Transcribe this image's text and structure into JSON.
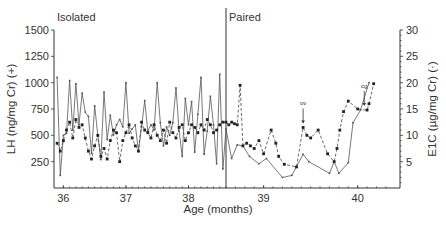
{
  "chart_data": {
    "type": "line",
    "title": "",
    "xlabel": "Age (months)",
    "ylabel_left": "LH (ng/mg Cr) (+)",
    "ylabel_right": "E1C (µg/mg Cr) (·)",
    "xlim": [
      35.85,
      40.45
    ],
    "x_break": 38.6,
    "ylim_left": [
      0,
      1500
    ],
    "ylim_right": [
      0,
      30
    ],
    "x_ticks": [
      36,
      37,
      38,
      39,
      40
    ],
    "x_tick_labels": [
      "36",
      "37",
      "38",
      "39",
      "40"
    ],
    "y_ticks_left": [
      250,
      500,
      750,
      1000,
      1250,
      1500
    ],
    "y_tick_labels_left": [
      "250",
      "500",
      "750",
      "1000",
      "1250",
      "1500"
    ],
    "y_ticks_right": [
      5,
      10,
      15,
      20,
      25,
      30
    ],
    "y_tick_labels_right": [
      "5",
      "10",
      "15",
      "20",
      "25",
      "30"
    ],
    "grid": false,
    "phase_labels": [
      "Isolated",
      "Paired"
    ],
    "phase_divider_x": 38.6,
    "annotations": [
      {
        "text": "ov",
        "x": 39.42,
        "series": "E1C"
      },
      {
        "text": "cg",
        "x": 40.07,
        "series": "E1C"
      }
    ],
    "series": [
      {
        "name": "LH (ng/mg Cr)",
        "axis": "left",
        "style": "solid",
        "marker": "plus",
        "x": [
          35.9,
          35.95,
          36.0,
          36.05,
          36.1,
          36.15,
          36.2,
          36.25,
          36.3,
          36.35,
          36.4,
          36.45,
          36.5,
          36.55,
          36.6,
          36.65,
          36.7,
          36.75,
          36.8,
          36.85,
          36.9,
          36.95,
          37.0,
          37.05,
          37.1,
          37.15,
          37.2,
          37.25,
          37.3,
          37.35,
          37.4,
          37.45,
          37.5,
          37.55,
          37.6,
          37.65,
          37.7,
          37.75,
          37.8,
          37.85,
          37.9,
          37.95,
          38.0,
          38.05,
          38.1,
          38.15,
          38.2,
          38.25,
          38.3,
          38.35,
          38.4,
          38.45,
          38.5,
          38.55,
          38.6,
          38.66,
          38.72,
          38.78,
          38.85,
          38.95,
          39.03,
          39.2,
          39.3,
          39.42,
          39.48,
          39.7,
          39.75,
          39.8,
          39.9,
          39.95,
          40.03,
          40.12
        ],
        "values": [
          1050,
          120,
          500,
          520,
          1020,
          550,
          990,
          600,
          900,
          720,
          680,
          330,
          780,
          500,
          270,
          910,
          460,
          690,
          500,
          600,
          650,
          580,
          1000,
          520,
          560,
          600,
          350,
          580,
          830,
          540,
          600,
          550,
          1000,
          620,
          400,
          580,
          500,
          620,
          950,
          540,
          300,
          850,
          600,
          820,
          340,
          700,
          1050,
          320,
          540,
          870,
          600,
          230,
          1080,
          180,
          560,
          280,
          410,
          400,
          300,
          230,
          280,
          100,
          120,
          320,
          250,
          140,
          250,
          140,
          240,
          620,
          740,
          1000
        ]
      },
      {
        "name": "E1C (µg/mg Cr)",
        "axis": "right",
        "style": "dashed",
        "marker": "dot",
        "x": [
          35.9,
          35.95,
          36.0,
          36.05,
          36.1,
          36.15,
          36.2,
          36.25,
          36.3,
          36.35,
          36.4,
          36.45,
          36.5,
          36.55,
          36.6,
          36.65,
          36.7,
          36.75,
          36.8,
          36.85,
          36.9,
          36.95,
          37.0,
          37.05,
          37.1,
          37.15,
          37.2,
          37.25,
          37.3,
          37.35,
          37.4,
          37.45,
          37.5,
          37.55,
          37.6,
          37.65,
          37.7,
          37.75,
          37.8,
          37.85,
          37.9,
          37.95,
          38.0,
          38.05,
          38.1,
          38.15,
          38.2,
          38.25,
          38.3,
          38.35,
          38.4,
          38.45,
          38.5,
          38.55,
          38.6,
          38.63,
          38.66,
          38.69,
          38.72,
          38.75,
          38.78,
          38.82,
          38.86,
          38.9,
          38.95,
          39.0,
          39.08,
          39.13,
          39.16,
          39.22,
          39.35,
          39.42,
          39.46,
          39.5,
          39.58,
          39.68,
          39.75,
          39.78,
          39.81,
          39.85,
          39.9,
          40.0,
          40.1,
          40.12,
          40.17
        ],
        "values": [
          8.5,
          7.0,
          9.0,
          11.0,
          12.5,
          9.5,
          13.0,
          11.5,
          12.0,
          9.5,
          7.0,
          5.5,
          8.0,
          10.0,
          6.0,
          7.5,
          5.5,
          9.0,
          11.0,
          10.5,
          5.0,
          9.0,
          10.5,
          12.0,
          9.5,
          8.0,
          7.0,
          12.5,
          11.0,
          10.5,
          9.5,
          12.0,
          10.0,
          9.0,
          11.0,
          8.5,
          12.5,
          10.5,
          9.5,
          11.5,
          12.0,
          9.0,
          10.5,
          12.0,
          11.5,
          10.5,
          12.0,
          11.0,
          13.0,
          12.0,
          10.5,
          11.0,
          12.0,
          12.5,
          12.5,
          12.0,
          12.5,
          12.2,
          12.0,
          19.5,
          8.0,
          8.5,
          8.0,
          7.5,
          9.0,
          6.5,
          11.0,
          8.5,
          6.0,
          4.5,
          4.0,
          11.5,
          10.0,
          9.5,
          11.0,
          6.5,
          5.0,
          7.5,
          11.0,
          14.5,
          16.5,
          15.0,
          14.8,
          16.0,
          19.8
        ]
      }
    ]
  }
}
